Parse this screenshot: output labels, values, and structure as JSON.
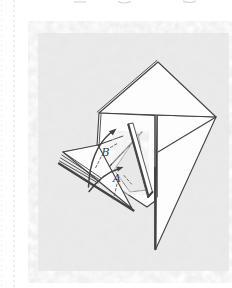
{
  "page": {
    "background_color": "#ffffff",
    "margin_rule_color": "#d8d8d8",
    "edge_mark_color": "#d3d3d3"
  },
  "figure": {
    "kind": "origami-step-diagram",
    "paper_texture_color": "#ebebeb",
    "paper_texture_spot_color": "#c9c9c9",
    "line_color": "#424242",
    "model_paper_color": "#fdfdfd",
    "labels": {
      "b": "B",
      "a": "A"
    }
  }
}
